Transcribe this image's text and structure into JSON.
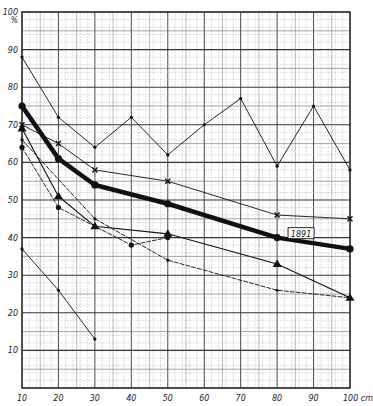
{
  "chart_data": {
    "type": "line",
    "title": "",
    "xlabel": "cm",
    "ylabel": "%",
    "xlim": [
      10,
      100
    ],
    "ylim": [
      0,
      100
    ],
    "grid": true,
    "x_ticks": [
      "10",
      "20",
      "30",
      "40",
      "50",
      "60",
      "70",
      "80",
      "90",
      "100 cm"
    ],
    "y_ticks": [
      "10",
      "20",
      "30",
      "40",
      "50",
      "60",
      "70",
      "80",
      "90",
      "100"
    ],
    "y_unit_label": "%",
    "annotations": [
      {
        "text": "1891",
        "x": 83,
        "y": 40.5
      }
    ],
    "series": [
      {
        "name": "series-thin-dots-top",
        "style": "thin-solid",
        "marker": "small-dot",
        "points": [
          [
            10,
            88
          ],
          [
            20,
            72
          ],
          [
            30,
            64
          ],
          [
            40,
            72
          ],
          [
            50,
            62
          ],
          [
            60,
            70
          ],
          [
            70,
            77
          ],
          [
            80,
            59
          ],
          [
            90,
            75
          ],
          [
            100,
            58
          ]
        ]
      },
      {
        "name": "series-cross",
        "style": "thin-solid",
        "marker": "x",
        "points": [
          [
            10,
            70
          ],
          [
            20,
            65
          ],
          [
            30,
            58
          ],
          [
            50,
            55
          ],
          [
            80,
            46
          ],
          [
            100,
            45
          ]
        ]
      },
      {
        "name": "1891",
        "style": "thick-solid",
        "marker": "big-dot",
        "points": [
          [
            10,
            75
          ],
          [
            20,
            61
          ],
          [
            30,
            54
          ],
          [
            50,
            49
          ],
          [
            80,
            40
          ],
          [
            100,
            37
          ]
        ]
      },
      {
        "name": "series-triangle",
        "style": "solid",
        "marker": "triangle",
        "points": [
          [
            10,
            69
          ],
          [
            20,
            51
          ],
          [
            30,
            43
          ],
          [
            50,
            41
          ],
          [
            80,
            33
          ],
          [
            100,
            24
          ]
        ]
      },
      {
        "name": "series-dashed-dot-a",
        "style": "dashed",
        "marker": "dot",
        "points": [
          [
            10,
            64
          ],
          [
            20,
            48
          ],
          [
            40,
            38
          ],
          [
            50,
            40
          ]
        ]
      },
      {
        "name": "series-dashed-b",
        "style": "dashed",
        "marker": "small-dot",
        "points": [
          [
            10,
            66
          ],
          [
            30,
            45
          ],
          [
            50,
            34
          ],
          [
            80,
            26
          ],
          [
            100,
            24
          ]
        ]
      },
      {
        "name": "series-thin-bottom",
        "style": "thin-solid",
        "marker": "small-dot",
        "points": [
          [
            10,
            37
          ],
          [
            20,
            26
          ],
          [
            30,
            13
          ]
        ]
      }
    ]
  }
}
